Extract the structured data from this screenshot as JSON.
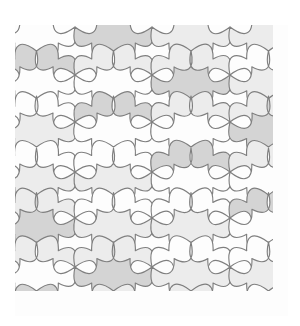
{
  "figure": {
    "background_color": "#ffffff"
  },
  "plate": {
    "x": 15,
    "y": 25,
    "width": 273,
    "height": 291,
    "edge_color": "#f2f2f2"
  },
  "style": {
    "stroke_color": "#7f7f7f",
    "stroke_width": 1.15,
    "tone_white": "#fdfdfd",
    "tone_light": "#ececec",
    "tone_medium": "#d4d4d4"
  },
  "chart_data": {
    "type": "diagram",
    "pattern": "four-cusped curved tile tessellation",
    "symmetry": "p4g-like staggered lattice with 4-fold cusp nodes",
    "tone_count": 3,
    "tones": [
      "#fdfdfd",
      "#ececec",
      "#d4d4d4"
    ],
    "lattice": {
      "node_columns": [
        -2,
        75,
        152,
        230,
        307
      ],
      "node_rows": [
        27,
        75,
        122,
        172,
        218,
        267,
        315
      ],
      "column_spacing": 77,
      "row_spacing": 48,
      "stagger": "alternate columns offset by one row"
    },
    "tile": {
      "cusps": 4,
      "arc_bulge": 0.42,
      "lobe_depth": 0.3
    }
  }
}
